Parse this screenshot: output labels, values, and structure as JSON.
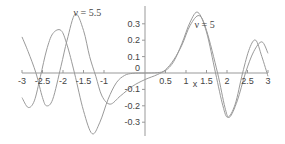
{
  "chart_data": {
    "type": "line",
    "title": "",
    "xlabel": "x",
    "ylabel": "",
    "xlim": [
      -3,
      3
    ],
    "ylim": [
      -0.35,
      0.38
    ],
    "grid": false,
    "legend": "inline annotations",
    "x_ticks": [
      "-3",
      "-2.5",
      "-2",
      "-1.5",
      "-1",
      "0.5",
      "1",
      "1.5",
      "2",
      "2.5",
      "3"
    ],
    "x_tick_values": [
      -3,
      -2.5,
      -2,
      -1.5,
      -1,
      0.5,
      1,
      1.5,
      2,
      2.5,
      3
    ],
    "y_ticks": [
      "0.3",
      "0.2",
      "0.1",
      "0",
      "-0.1",
      "-0.2",
      "-0.3"
    ],
    "y_tick_values": [
      0.3,
      0.2,
      0.1,
      0,
      -0.1,
      -0.2,
      -0.3
    ],
    "annotations": [
      {
        "text": "ν = 5.5",
        "x": -1.4,
        "y": 0.37
      },
      {
        "text": "ν = 5",
        "x": 1.55,
        "y": 0.3
      }
    ],
    "series": [
      {
        "name": "ν = 5",
        "x": [
          -3,
          -2.85,
          -2.7,
          -2.55,
          -2.4,
          -2.25,
          -2.05,
          -1.9,
          -1.72,
          -1.5,
          -1.29,
          -1.1,
          -0.9,
          -0.7,
          -0.5,
          -0.3,
          0,
          0.3,
          0.5,
          0.7,
          0.9,
          1.1,
          1.29,
          1.5,
          1.72,
          1.9,
          2.02,
          2.2,
          2.38,
          2.55,
          2.7,
          2.85,
          3
        ],
        "y": [
          -0.15,
          -0.21,
          -0.17,
          -0.02,
          0.14,
          0.24,
          0.26,
          0.17,
          0.0,
          -0.23,
          -0.37,
          -0.3,
          -0.16,
          -0.06,
          -0.015,
          -0.002,
          0,
          0.002,
          0.015,
          0.07,
          0.18,
          0.31,
          0.37,
          0.25,
          0.0,
          -0.2,
          -0.27,
          -0.19,
          0.0,
          0.15,
          0.2,
          0.1,
          -0.02
        ]
      },
      {
        "name": "ν = 5.5",
        "x": [
          -3,
          -2.85,
          -2.66,
          -2.5,
          -2.4,
          -2.25,
          -2.05,
          -1.9,
          -1.7,
          -1.5,
          -1.35,
          -1.2,
          -1.05,
          -0.85,
          -0.6,
          -0.3,
          0,
          0.3,
          0.5,
          0.7,
          0.9,
          1.1,
          1.32,
          1.5,
          1.77,
          1.95,
          2.06,
          2.25,
          2.45,
          2.65,
          2.85,
          3
        ],
        "y": [
          0.22,
          0.13,
          0.0,
          -0.15,
          -0.2,
          -0.16,
          0.04,
          0.2,
          0.36,
          0.26,
          0.1,
          -0.02,
          -0.14,
          -0.19,
          -0.14,
          -0.08,
          -0.04,
          -0.01,
          0.02,
          0.08,
          0.17,
          0.29,
          0.35,
          0.26,
          0.0,
          -0.21,
          -0.27,
          -0.17,
          0.0,
          0.13,
          0.19,
          0.12
        ]
      }
    ]
  },
  "colors": {
    "axis": "#999999",
    "curve": "#9a9a9a",
    "text": "#444444"
  }
}
